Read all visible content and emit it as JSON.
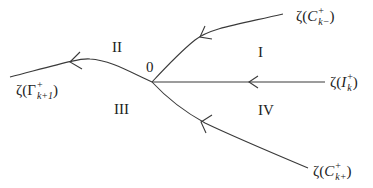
{
  "diagram": {
    "origin_label": "0",
    "regions": {
      "I": "I",
      "II": "II",
      "III": "III",
      "IV": "IV"
    },
    "curves": [
      {
        "id": "gamma",
        "prefix": "ζ(",
        "base": "Γ",
        "sup": "+",
        "sub": "k+1",
        "suffix": ")"
      },
      {
        "id": "c-k-minus",
        "prefix": "ζ(",
        "base": "C",
        "sup": "+",
        "sub": "k−",
        "suffix": ")"
      },
      {
        "id": "i-k",
        "prefix": "ζ(",
        "base": "I",
        "sup": "+",
        "sub": "k",
        "suffix": ")"
      },
      {
        "id": "c-k-plus",
        "prefix": "ζ(",
        "base": "C",
        "sup": "+",
        "sub": "k+",
        "suffix": ")"
      }
    ],
    "colors": {
      "stroke": "#3a3a3a",
      "text": "#222222",
      "background": "#ffffff"
    }
  }
}
